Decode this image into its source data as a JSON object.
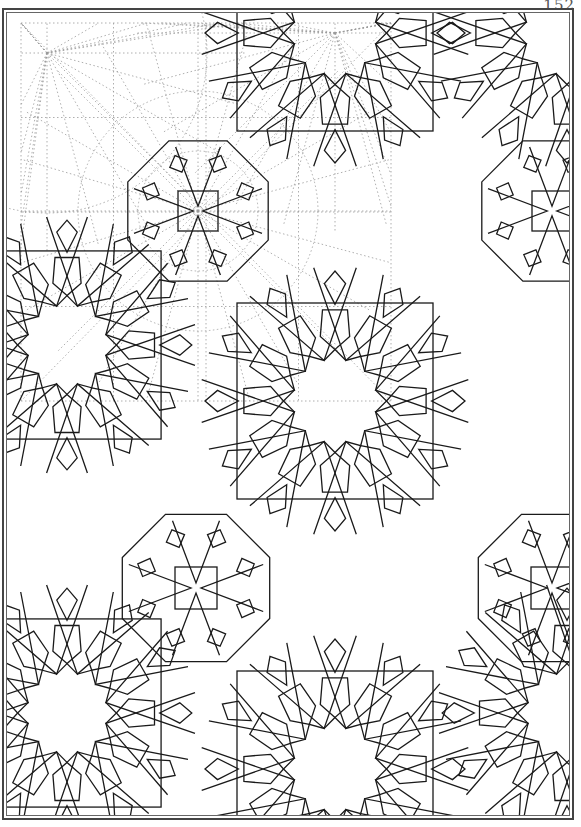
{
  "page": {
    "number": "152",
    "title": ""
  },
  "colors": {
    "line": "#1a1a1a",
    "construction": "#9a9a9a",
    "frame": "#444444",
    "background": "#ffffff"
  },
  "pattern": {
    "rosettes": [
      {
        "cx": 328,
        "cy": 388,
        "r": 100,
        "type": "12-fold",
        "square": true
      },
      {
        "cx": 60,
        "cy": 332,
        "r": 96,
        "type": "12-fold",
        "square": true
      },
      {
        "cx": 328,
        "cy": 20,
        "r": 100,
        "type": "12-fold",
        "square": true
      },
      {
        "cx": 60,
        "cy": 700,
        "r": 96,
        "type": "12-fold",
        "square": true
      },
      {
        "cx": 328,
        "cy": 756,
        "r": 100,
        "type": "12-fold",
        "square": true
      },
      {
        "cx": 560,
        "cy": 20,
        "r": 100,
        "type": "12-fold",
        "square": false
      },
      {
        "cx": 560,
        "cy": 700,
        "r": 96,
        "type": "12-fold",
        "square": false
      }
    ],
    "crosses": [
      {
        "cx": 191,
        "cy": 198,
        "s": 40
      },
      {
        "cx": 189,
        "cy": 575,
        "s": 42
      },
      {
        "cx": 545,
        "cy": 198,
        "s": 40
      },
      {
        "cx": 545,
        "cy": 575,
        "s": 42
      }
    ],
    "construction_region": {
      "x": 14,
      "y": 10,
      "w": 370,
      "h": 378
    }
  }
}
